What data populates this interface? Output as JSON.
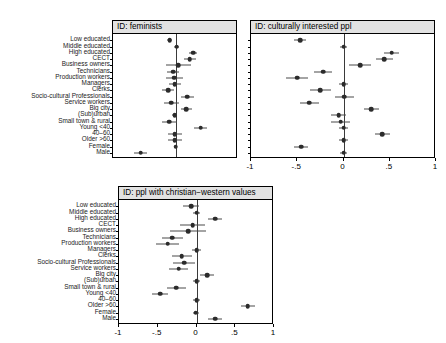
{
  "figure": {
    "type": "forest-plot-grid",
    "panel_count": 3,
    "categories": [
      "Low educated",
      "Middle educated",
      "High educated",
      "CECT",
      "Business owners",
      "Technicians",
      "Production workers",
      "Managers",
      "Clerks",
      "Socio-cultural Professionals",
      "Service workers",
      "Big city",
      "(Sub)urban",
      "Small town & rural",
      "Young <40",
      "40–60",
      "Older >60",
      "Female",
      "Male"
    ],
    "xtick_labels": [
      "-1",
      "-.5",
      "0",
      ".5",
      "1"
    ],
    "xtick_values": [
      -1,
      -0.5,
      0,
      0.5,
      1
    ],
    "colors": {
      "point": "#2b2b2b",
      "interval": "#4a4a4a",
      "zero_line": "#3a3a3a",
      "title_background": "#e2e2e2",
      "frame": "#000000"
    }
  },
  "chart_data": [
    {
      "type": "scatter",
      "subtype": "forest-plot",
      "title": "ID: feminists",
      "xlabel": "",
      "ylabel": "",
      "xlim": [
        -1,
        1
      ],
      "xticks_shown": false,
      "grid": false,
      "reference_line": 0,
      "categories": [
        "Low educated",
        "Middle educated",
        "High educated",
        "CECT",
        "Business owners",
        "Technicians",
        "Production workers",
        "Managers",
        "Clerks",
        "Socio-cultural Professionals",
        "Service workers",
        "Big city",
        "(Sub)urban",
        "Small town & rural",
        "Young <40",
        "40–60",
        "Older >60",
        "Female",
        "Male"
      ],
      "estimates": [
        -0.09,
        0.02,
        0.28,
        0.23,
        0.04,
        -0.04,
        -0.02,
        -0.01,
        -0.12,
        0.19,
        -0.07,
        0.17,
        -0.01,
        -0.1,
        0.4,
        -0.01,
        -0.01,
        0.0,
        -0.56
      ],
      "ci_low": [
        -0.13,
        -0.02,
        0.21,
        0.14,
        -0.16,
        -0.14,
        -0.16,
        -0.11,
        -0.22,
        0.08,
        -0.19,
        0.08,
        -0.05,
        -0.22,
        0.3,
        -0.12,
        -0.12,
        -0.03,
        -0.66
      ],
      "ci_high": [
        -0.05,
        0.06,
        0.35,
        0.32,
        0.24,
        0.06,
        0.12,
        0.09,
        -0.02,
        0.3,
        0.05,
        0.26,
        0.03,
        0.02,
        0.5,
        0.1,
        0.1,
        0.03,
        -0.46
      ]
    },
    {
      "type": "scatter",
      "subtype": "forest-plot",
      "title": "ID: culturally interested ppl",
      "xlabel": "",
      "ylabel": "",
      "xlim": [
        -1,
        1
      ],
      "xticks_shown": true,
      "grid": false,
      "reference_line": 0,
      "categories": [
        "Low educated",
        "Middle educated",
        "High educated",
        "CECT",
        "Business owners",
        "Technicians",
        "Production workers",
        "Managers",
        "Clerks",
        "Socio-cultural Professionals",
        "Service workers",
        "Big city",
        "(Sub)urban",
        "Small town & rural",
        "Young <40",
        "40–60",
        "Older >60",
        "Female",
        "Male"
      ],
      "estimates": [
        -0.47,
        0.0,
        0.52,
        0.44,
        0.18,
        -0.22,
        -0.5,
        0.0,
        -0.25,
        0.01,
        -0.37,
        0.3,
        -0.05,
        -0.03,
        0.0,
        0.42,
        0.0,
        -0.46,
        0.0
      ],
      "ci_low": [
        -0.54,
        -0.04,
        0.44,
        0.35,
        0.06,
        -0.32,
        -0.62,
        -0.05,
        -0.36,
        -0.09,
        -0.47,
        0.22,
        -0.13,
        -0.13,
        -0.05,
        0.34,
        -0.05,
        -0.54,
        -0.04
      ],
      "ci_high": [
        -0.4,
        0.04,
        0.6,
        0.53,
        0.3,
        -0.12,
        -0.38,
        0.05,
        -0.14,
        0.11,
        -0.27,
        0.38,
        0.03,
        0.07,
        0.05,
        0.5,
        0.05,
        -0.38,
        0.04
      ]
    },
    {
      "type": "scatter",
      "subtype": "forest-plot",
      "title": "ID: ppl with christian−western values",
      "xlabel": "",
      "ylabel": "",
      "xlim": [
        -1,
        1
      ],
      "xticks_shown": true,
      "grid": false,
      "reference_line": 0,
      "categories": [
        "Low educated",
        "Middle educated",
        "High educated",
        "CECT",
        "Business owners",
        "Technicians",
        "Production workers",
        "Managers",
        "Clerks",
        "Socio-cultural Professionals",
        "Service workers",
        "Big city",
        "(Sub)urban",
        "Small town & rural",
        "Young <40",
        "40–60",
        "Older >60",
        "Female",
        "Male"
      ],
      "estimates": [
        -0.07,
        0.0,
        0.24,
        -0.05,
        -0.11,
        -0.31,
        -0.37,
        0.0,
        -0.19,
        -0.16,
        -0.23,
        0.14,
        0.0,
        -0.26,
        -0.47,
        0.0,
        0.66,
        -0.01,
        0.24
      ],
      "ci_low": [
        -0.17,
        -0.04,
        0.15,
        -0.21,
        -0.34,
        -0.45,
        -0.52,
        -0.06,
        -0.32,
        -0.3,
        -0.35,
        0.05,
        -0.04,
        -0.38,
        -0.57,
        -0.04,
        0.57,
        -0.05,
        0.15
      ],
      "ci_high": [
        0.03,
        0.04,
        0.33,
        0.11,
        0.12,
        -0.17,
        -0.22,
        0.06,
        -0.06,
        -0.02,
        -0.11,
        0.23,
        0.04,
        -0.14,
        -0.37,
        0.04,
        0.75,
        0.03,
        0.33
      ]
    }
  ]
}
